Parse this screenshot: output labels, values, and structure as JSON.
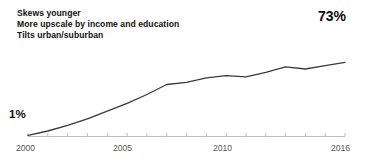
{
  "chart_data": {
    "type": "line",
    "title": "",
    "subtitle": "",
    "xlabel": "",
    "ylabel": "",
    "xlim": [
      2000,
      2016
    ],
    "ylim": [
      0,
      80
    ],
    "grid": false,
    "legend": false,
    "x": [
      2000,
      2001,
      2002,
      2003,
      2004,
      2005,
      2006,
      2007,
      2008,
      2009,
      2010,
      2011,
      2012,
      2013,
      2014,
      2015,
      2016
    ],
    "series": [
      {
        "name": "Share of adults",
        "values": [
          1,
          5,
          10,
          16,
          23,
          30,
          38,
          47,
          49,
          53,
          55,
          54,
          58,
          63,
          61,
          64,
          67
        ]
      }
    ],
    "tick_labels": [
      "2000",
      "2005",
      "2010",
      "2016"
    ],
    "tick_values": [
      2000,
      2005,
      2010,
      2016
    ],
    "minor_ticks_every": 1,
    "annotations": [
      {
        "name": "start-value",
        "text": "1%",
        "x": 2000,
        "y": 1
      },
      {
        "name": "end-value",
        "text": "73%",
        "x": 2016,
        "y": 67
      }
    ],
    "callout_lines": [
      "Skews younger",
      "More upscale by income and education",
      "Tilts urban/suburban"
    ],
    "colors": {
      "line": "#3a3a3a",
      "axis": "#bdbdbd",
      "tick_label": "#555555",
      "annotation_text": "#111111",
      "background": "#ffffff"
    }
  },
  "callout": {
    "line1": "Skews younger",
    "line2": "More upscale by income and education",
    "line3": "Tilts urban/suburban"
  },
  "labels": {
    "start_value": "1%",
    "end_value": "73%"
  },
  "axis": {
    "ticks": [
      {
        "label": "2000",
        "left": 16
      },
      {
        "label": "2005",
        "left": 113
      },
      {
        "label": "2010",
        "left": 213
      },
      {
        "label": "2016",
        "left": 331
      }
    ]
  }
}
